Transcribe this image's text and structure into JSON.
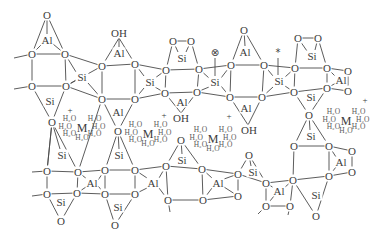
{
  "diagram": {
    "title": "",
    "labels": {
      "oxygen": "O",
      "silicon": "Si",
      "aluminium": "Al",
      "hydroxyl": "OH",
      "cation": "M",
      "water": "H₂O",
      "positive_charge": "+",
      "radical_marker": "⊗",
      "star_marker": "*"
    },
    "atoms": [
      {
        "el": "O",
        "x": 47,
        "y": 15
      },
      {
        "el": "Al",
        "x": 47,
        "y": 40
      },
      {
        "el": "O",
        "x": 32,
        "y": 54
      },
      {
        "el": "O",
        "x": 65,
        "y": 54
      },
      {
        "el": "Si",
        "x": 82,
        "y": 77
      },
      {
        "el": "O",
        "x": 32,
        "y": 86
      },
      {
        "el": "O",
        "x": 66,
        "y": 86
      },
      {
        "el": "Si",
        "x": 50,
        "y": 101
      },
      {
        "el": "O",
        "x": 52,
        "y": 122
      },
      {
        "el": "OH",
        "x": 119,
        "y": 33
      },
      {
        "el": "Al",
        "x": 119,
        "y": 53
      },
      {
        "el": "O",
        "x": 102,
        "y": 66
      },
      {
        "el": "O",
        "x": 135,
        "y": 64
      },
      {
        "el": "Si",
        "x": 150,
        "y": 82
      },
      {
        "el": "O",
        "x": 102,
        "y": 99
      },
      {
        "el": "O",
        "x": 135,
        "y": 99
      },
      {
        "el": "Al",
        "x": 118,
        "y": 112
      },
      {
        "el": "O",
        "x": 173,
        "y": 41
      },
      {
        "el": "O",
        "x": 191,
        "y": 41
      },
      {
        "el": "Si",
        "x": 182,
        "y": 58
      },
      {
        "el": "O",
        "x": 166,
        "y": 70
      },
      {
        "el": "O",
        "x": 199,
        "y": 69
      },
      {
        "el": "Si",
        "x": 215,
        "y": 82
      },
      {
        "el": "O",
        "x": 165,
        "y": 93
      },
      {
        "el": "O",
        "x": 197,
        "y": 92
      },
      {
        "el": "Al",
        "x": 182,
        "y": 102
      },
      {
        "el": "OH",
        "x": 181,
        "y": 118
      },
      {
        "el": "O",
        "x": 244,
        "y": 30
      },
      {
        "el": "Al",
        "x": 245,
        "y": 52
      },
      {
        "el": "O",
        "x": 231,
        "y": 65
      },
      {
        "el": "O",
        "x": 264,
        "y": 65
      },
      {
        "el": "Si",
        "x": 279,
        "y": 81
      },
      {
        "el": "O",
        "x": 230,
        "y": 97
      },
      {
        "el": "O",
        "x": 262,
        "y": 97
      },
      {
        "el": "Al",
        "x": 246,
        "y": 108
      },
      {
        "el": "OH",
        "x": 249,
        "y": 130
      },
      {
        "el": "O",
        "x": 298,
        "y": 38
      },
      {
        "el": "O",
        "x": 318,
        "y": 38
      },
      {
        "el": "Si",
        "x": 312,
        "y": 56
      },
      {
        "el": "O",
        "x": 295,
        "y": 68
      },
      {
        "el": "O",
        "x": 327,
        "y": 68
      },
      {
        "el": "O",
        "x": 348,
        "y": 71
      },
      {
        "el": "Al",
        "x": 341,
        "y": 80
      },
      {
        "el": "O",
        "x": 348,
        "y": 91
      },
      {
        "el": "O",
        "x": 327,
        "y": 88
      },
      {
        "el": "O",
        "x": 294,
        "y": 92
      },
      {
        "el": "Si",
        "x": 311,
        "y": 97
      },
      {
        "el": "O",
        "x": 309,
        "y": 115
      },
      {
        "el": "Si",
        "x": 311,
        "y": 136
      },
      {
        "el": "O",
        "x": 294,
        "y": 146
      },
      {
        "el": "O",
        "x": 329,
        "y": 146
      },
      {
        "el": "O",
        "x": 352,
        "y": 151
      },
      {
        "el": "Al",
        "x": 341,
        "y": 162
      },
      {
        "el": "O",
        "x": 352,
        "y": 172
      },
      {
        "el": "O",
        "x": 329,
        "y": 176
      },
      {
        "el": "O",
        "x": 293,
        "y": 180
      },
      {
        "el": "Si",
        "x": 316,
        "y": 195
      },
      {
        "el": "O",
        "x": 316,
        "y": 216
      },
      {
        "el": "Si",
        "x": 62,
        "y": 155
      },
      {
        "el": "O",
        "x": 47,
        "y": 171
      },
      {
        "el": "O",
        "x": 78,
        "y": 172
      },
      {
        "el": "Al",
        "x": 92,
        "y": 183
      },
      {
        "el": "O",
        "x": 47,
        "y": 194
      },
      {
        "el": "O",
        "x": 77,
        "y": 193
      },
      {
        "el": "Si",
        "x": 61,
        "y": 202
      },
      {
        "el": "O",
        "x": 61,
        "y": 221
      },
      {
        "el": "O",
        "x": 118,
        "y": 131
      },
      {
        "el": "Si",
        "x": 119,
        "y": 155
      },
      {
        "el": "O",
        "x": 105,
        "y": 170
      },
      {
        "el": "O",
        "x": 135,
        "y": 170
      },
      {
        "el": "O",
        "x": 105,
        "y": 194
      },
      {
        "el": "O",
        "x": 135,
        "y": 194
      },
      {
        "el": "Si",
        "x": 118,
        "y": 207
      },
      {
        "el": "O",
        "x": 115,
        "y": 225
      },
      {
        "el": "Al",
        "x": 153,
        "y": 183
      },
      {
        "el": "O",
        "x": 181,
        "y": 140
      },
      {
        "el": "Si",
        "x": 182,
        "y": 160
      },
      {
        "el": "O",
        "x": 166,
        "y": 166
      },
      {
        "el": "O",
        "x": 202,
        "y": 169
      },
      {
        "el": "O",
        "x": 168,
        "y": 200
      },
      {
        "el": "O",
        "x": 203,
        "y": 200
      },
      {
        "el": "Al",
        "x": 218,
        "y": 183
      },
      {
        "el": "O",
        "x": 249,
        "y": 155
      },
      {
        "el": "Si",
        "x": 253,
        "y": 172
      },
      {
        "el": "O",
        "x": 238,
        "y": 174
      },
      {
        "el": "O",
        "x": 266,
        "y": 183
      },
      {
        "el": "O",
        "x": 238,
        "y": 196
      },
      {
        "el": "Al",
        "x": 279,
        "y": 191
      },
      {
        "el": "O",
        "x": 266,
        "y": 206
      },
      {
        "el": "O",
        "x": 290,
        "y": 206
      }
    ],
    "cages": [
      {
        "cation": "M",
        "charge": "+",
        "cx": 82,
        "cy": 128,
        "charge_pos": {
          "x": 70,
          "y": 110
        },
        "water_count": 7
      },
      {
        "cation": "M",
        "charge": "+",
        "cx": 148,
        "cy": 134,
        "charge_pos": {
          "x": 164,
          "y": 115
        },
        "water_count": 7
      },
      {
        "cation": "M",
        "charge": "+",
        "cx": 213,
        "cy": 139,
        "charge_pos": {
          "x": 229,
          "y": 116
        },
        "water_count": 7
      },
      {
        "cation": "M",
        "charge": "+",
        "cx": 346,
        "cy": 121,
        "charge_pos": {
          "x": 365,
          "y": 100
        },
        "water_count": 7
      }
    ],
    "markers": [
      {
        "type": "radical_marker",
        "x": 215,
        "y": 52
      },
      {
        "type": "star_marker",
        "x": 278,
        "y": 52
      }
    ]
  }
}
